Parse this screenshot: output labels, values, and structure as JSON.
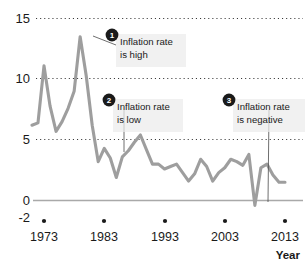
{
  "chart_data": {
    "type": "line",
    "title": "",
    "xlabel": "Year",
    "ylabel": "",
    "xlim": [
      1971,
      2014
    ],
    "ylim": [
      -2,
      15
    ],
    "grid": true,
    "grid_style": "dotted horizontal",
    "legend": "none",
    "line_color": "#9e9e9e",
    "axis_color": "#a9a9a9",
    "text_color": "#1a1a1a",
    "y_ticks": [
      "15",
      "10",
      "5",
      "0",
      "-2"
    ],
    "y_tick_values": [
      15,
      10,
      5,
      0,
      -2
    ],
    "x_ticks": [
      "1973",
      "1983",
      "1993",
      "2003",
      "2013"
    ],
    "x_tick_values": [
      1973,
      1983,
      1993,
      2003,
      2013
    ],
    "series": [
      {
        "name": "Inflation rate",
        "x": [
          1971,
          1972,
          1973,
          1974,
          1975,
          1976,
          1977,
          1978,
          1979,
          1980,
          1981,
          1982,
          1983,
          1984,
          1985,
          1986,
          1987,
          1988,
          1989,
          1990,
          1991,
          1992,
          1993,
          1994,
          1995,
          1996,
          1997,
          1998,
          1999,
          2000,
          2001,
          2002,
          2003,
          2004,
          2005,
          2006,
          2007,
          2008,
          2009,
          2010,
          2011,
          2012,
          2013
        ],
        "values": [
          6.2,
          6.4,
          11.1,
          7.8,
          5.7,
          6.5,
          7.6,
          9.0,
          13.5,
          10.3,
          6.2,
          3.2,
          4.3,
          3.5,
          1.9,
          3.6,
          4.1,
          4.8,
          5.4,
          4.2,
          3.0,
          3.0,
          2.6,
          2.8,
          3.0,
          2.3,
          1.6,
          2.2,
          3.4,
          2.8,
          1.6,
          2.3,
          2.7,
          3.4,
          3.2,
          2.9,
          3.8,
          -0.4,
          2.7,
          3.0,
          2.1,
          1.5,
          1.5
        ],
        "color": "#9e9e9e"
      }
    ],
    "annotations": [
      {
        "number": "1",
        "text_line1": "Inflation rate",
        "text_line2": "is high",
        "points_to_year": 1980,
        "points_to_value": 13.5
      },
      {
        "number": "2",
        "text_line1": "Inflation rate",
        "text_line2": "is low",
        "points_to_year": 1986,
        "points_to_value": 1.9
      },
      {
        "number": "3",
        "text_line1": "Inflation rate",
        "text_line2": "is negative",
        "points_to_year": 2009,
        "points_to_value": -0.4
      }
    ]
  }
}
